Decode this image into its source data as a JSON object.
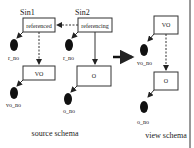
{
  "diagram": {
    "source": {
      "caption": "source schema",
      "nodes": [
        {
          "id": "sin1",
          "title": "Sin1",
          "label": "referenced",
          "attr": "r_no"
        },
        {
          "id": "sin2",
          "title": "Sin2",
          "label": "referencing",
          "attr": "r_no"
        },
        {
          "id": "vo",
          "label": "VO",
          "attr": "vo_no"
        },
        {
          "id": "o",
          "label": "O",
          "attr": "o_no"
        }
      ]
    },
    "view": {
      "caption": "view schema",
      "nodes": [
        {
          "id": "vvo",
          "label": "VO",
          "attr": "vo_no"
        },
        {
          "id": "vo2",
          "label": "O",
          "attr": "o_no"
        }
      ]
    },
    "transform_arrow": "maps to"
  }
}
